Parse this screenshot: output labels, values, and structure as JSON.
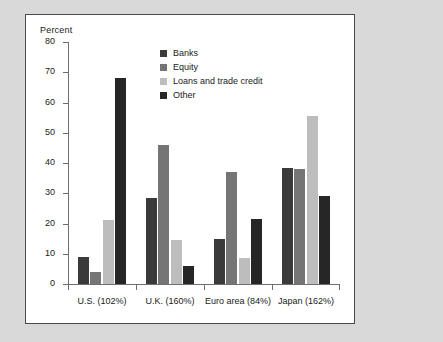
{
  "chart_data": {
    "type": "bar",
    "title": "",
    "subtitle": "",
    "xlabel": "",
    "ylabel": "Percent",
    "ylim": [
      0,
      80
    ],
    "yticks": [
      0,
      10,
      20,
      30,
      40,
      50,
      60,
      70,
      80
    ],
    "ytick_labels": [
      "0",
      "10",
      "20",
      "30",
      "40",
      "50",
      "60",
      "70",
      "80"
    ],
    "grid": false,
    "legend_position": "inside-upper-center",
    "categories": [
      "U.S. (102%)",
      "U.K. (160%)",
      "Euro area (84%)",
      "Japan (162%)"
    ],
    "series": [
      {
        "name": "Banks",
        "color": "#3a3a3a",
        "values": [
          9,
          28.5,
          15,
          38.5
        ]
      },
      {
        "name": "Equity",
        "color": "#757575",
        "values": [
          4,
          46,
          37,
          38
        ]
      },
      {
        "name": "Loans and trade credit",
        "color": "#bdbdbd",
        "values": [
          21,
          14.5,
          8.5,
          55.5
        ]
      },
      {
        "name": "Other",
        "color": "#262626",
        "values": [
          68,
          6,
          21.5,
          29
        ]
      }
    ]
  },
  "figure": {
    "axis_title": "Percent",
    "background_color": "#d9d9d9",
    "plot_background_color": "#ffffff",
    "frame_color": "#4a4a4a",
    "axis_color": "#6e6e6e"
  }
}
